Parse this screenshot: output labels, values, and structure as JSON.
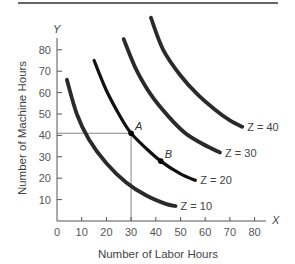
{
  "chart_data": {
    "type": "line",
    "title": "",
    "xlabel": "Number of Labor Hours",
    "ylabel": "Number of Machine Hours",
    "x_axis_letter": "X",
    "y_axis_letter": "Y",
    "xlim": [
      0,
      85
    ],
    "ylim": [
      0,
      85
    ],
    "x_ticks": [
      0,
      10,
      20,
      30,
      40,
      50,
      60,
      70,
      80
    ],
    "y_ticks": [
      10,
      20,
      30,
      40,
      50,
      60,
      70,
      80
    ],
    "grid": false,
    "legend": "inline labels at curve ends",
    "series": [
      {
        "name": "Z = 10",
        "label": "Z = 10",
        "x": [
          4,
          8,
          13,
          20,
          28,
          36,
          44,
          48
        ],
        "y": [
          66,
          50,
          38,
          27,
          18,
          12,
          8,
          7
        ]
      },
      {
        "name": "Z = 20",
        "label": "Z = 20",
        "x": [
          15,
          20,
          26,
          30,
          36,
          42,
          50,
          56
        ],
        "y": [
          75,
          61,
          48,
          41,
          34,
          28,
          22,
          19
        ]
      },
      {
        "name": "Z = 30",
        "label": "Z = 30",
        "x": [
          27,
          32,
          38,
          45,
          52,
          59,
          66
        ],
        "y": [
          85,
          71,
          59,
          49,
          41,
          36,
          32
        ]
      },
      {
        "name": "Z = 40",
        "label": "Z = 40",
        "x": [
          38,
          43,
          50,
          57,
          64,
          70,
          75
        ],
        "y": [
          95,
          80,
          68,
          59,
          52,
          47,
          44
        ]
      }
    ],
    "annotations": [
      {
        "label": "A",
        "x": 30,
        "y": 41,
        "guide_lines": true
      },
      {
        "label": "B",
        "x": 42,
        "y": 28,
        "guide_lines": false
      }
    ]
  }
}
